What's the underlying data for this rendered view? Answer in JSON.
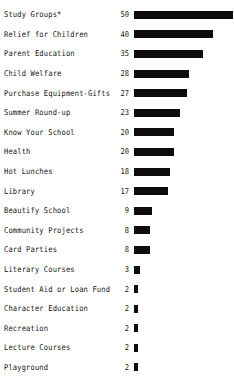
{
  "chart_data": {
    "type": "bar",
    "orientation": "horizontal",
    "title": "",
    "subtitle": "",
    "xlabel": "",
    "ylabel": "",
    "xlim": [
      0,
      50
    ],
    "grid": false,
    "legend": null,
    "bar_color": "#0d0d0d",
    "background_color": "#ffffff",
    "value_labels_shown": true,
    "axis_lines_shown": false,
    "tick_labels_shown": false,
    "categories": [
      "Study Groups*",
      "Relief for Children",
      "Parent Education",
      "Child Welfare",
      "Purchase Equipment-Gifts",
      "Summer Round-up",
      "Know Your School",
      "Health",
      "Hot Lunches",
      "Library",
      "Beautify School",
      "Community Projects",
      "Card Parties",
      "Literary Courses",
      "Student Aid or Loan Fund",
      "Character Education",
      "Recreation",
      "Lecture Courses",
      "Playground"
    ],
    "values": [
      50,
      40,
      35,
      28,
      27,
      23,
      20,
      20,
      18,
      17,
      9,
      8,
      8,
      3,
      2,
      2,
      2,
      2,
      2
    ],
    "rows": [
      {
        "category": "Study Groups*",
        "value": 50,
        "value_label": "50"
      },
      {
        "category": "Relief for Children",
        "value": 40,
        "value_label": "40"
      },
      {
        "category": "Parent Education",
        "value": 35,
        "value_label": "35"
      },
      {
        "category": "Child Welfare",
        "value": 28,
        "value_label": "28"
      },
      {
        "category": "Purchase Equipment-Gifts",
        "value": 27,
        "value_label": "27"
      },
      {
        "category": "Summer Round-up",
        "value": 23,
        "value_label": "23"
      },
      {
        "category": "Know Your School",
        "value": 20,
        "value_label": "20"
      },
      {
        "category": "Health",
        "value": 20,
        "value_label": "20"
      },
      {
        "category": "Hot Lunches",
        "value": 18,
        "value_label": "18"
      },
      {
        "category": "Library",
        "value": 17,
        "value_label": "17"
      },
      {
        "category": "Beautify School",
        "value": 9,
        "value_label": "9"
      },
      {
        "category": "Community Projects",
        "value": 8,
        "value_label": "8"
      },
      {
        "category": "Card Parties",
        "value": 8,
        "value_label": "8"
      },
      {
        "category": "Literary Courses",
        "value": 3,
        "value_label": "3"
      },
      {
        "category": "Student Aid or Loan Fund",
        "value": 2,
        "value_label": "2"
      },
      {
        "category": "Character Education",
        "value": 2,
        "value_label": "2"
      },
      {
        "category": "Recreation",
        "value": 2,
        "value_label": "2"
      },
      {
        "category": "Lecture Courses",
        "value": 2,
        "value_label": "2"
      },
      {
        "category": "Playground",
        "value": 2,
        "value_label": "2"
      }
    ]
  }
}
